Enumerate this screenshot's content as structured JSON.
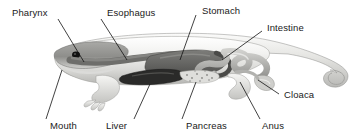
{
  "figure": {
    "style": "grayscale anatomical illustration with leader-line callouts",
    "background_color": "#ffffff",
    "label_color": "#1a1a1a",
    "leader_line_color": "#111111"
  },
  "labels": [
    {
      "id": "pharynx",
      "text": "Pharynx",
      "x": 8,
      "y": 8,
      "side": "top"
    },
    {
      "id": "esophagus",
      "text": "Esophagus",
      "x": 104,
      "y": 8,
      "side": "top"
    },
    {
      "id": "stomach",
      "text": "Stomach",
      "x": 200,
      "y": 6,
      "side": "top"
    },
    {
      "id": "intestine",
      "text": "Intestine",
      "x": 265,
      "y": 23,
      "side": "top"
    },
    {
      "id": "cloaca",
      "text": "Cloaca",
      "x": 281,
      "y": 90,
      "side": "bottom"
    },
    {
      "id": "anus",
      "text": "Anus",
      "x": 257,
      "y": 122,
      "side": "bottom"
    },
    {
      "id": "pancreas",
      "text": "Pancreas",
      "x": 184,
      "y": 122,
      "side": "bottom"
    },
    {
      "id": "liver",
      "text": "Liver",
      "x": 104,
      "y": 120,
      "side": "bottom"
    },
    {
      "id": "mouth",
      "text": "Mouth",
      "x": 48,
      "y": 120,
      "side": "bottom"
    }
  ],
  "organ_colors": {
    "body_light": "#ededea",
    "body_mid": "#c9c9c6",
    "body_shadow": "#9c9c99",
    "pharynx_dark": "#6e6e6b",
    "stomach_dark": "#595957",
    "liver_dark": "#2a2a29",
    "eye": "#111111"
  }
}
